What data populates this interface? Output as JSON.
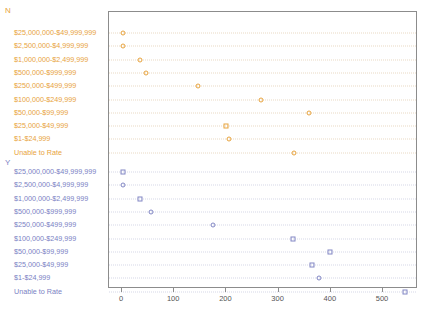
{
  "chart_data": {
    "type": "scatter",
    "title": "",
    "subtitle": "",
    "xlabel": "",
    "ylabel": "",
    "xlim": [
      -25,
      567
    ],
    "ylim": null,
    "grid": true,
    "legend_position": "none",
    "orientation": "horizontal",
    "panel_variable": "Rating",
    "categories": [
      "$25,000,000-$49,999,999",
      "$2,500,000-$4,999,999",
      "$1,000,000-$2,499,999",
      "$500,000-$999,999",
      "$250,000-$499,999",
      "$100,000-$249,999",
      "$50,000-$99,999",
      "$25,000-$49,999",
      "$1-$24,999",
      "Unable to Rate"
    ],
    "panels": [
      {
        "name": "N",
        "label": "N",
        "color": "#e8a33d",
        "values": [
          3,
          3,
          36,
          47,
          148,
          268,
          360,
          201,
          206,
          331
        ],
        "markers": [
          "circle",
          "circle",
          "circle",
          "circle",
          "circle",
          "circle",
          "circle",
          "square",
          "circle",
          "circle"
        ]
      },
      {
        "name": "Y",
        "label": "Y",
        "color": "#8186c4",
        "values": [
          4,
          3,
          37,
          57,
          177,
          329,
          401,
          365,
          379,
          544
        ],
        "markers": [
          "square",
          "circle",
          "square",
          "circle",
          "circle",
          "square",
          "square",
          "square",
          "circle",
          "square"
        ]
      }
    ],
    "xticks": [
      0,
      100,
      200,
      300,
      400,
      500
    ],
    "xtick_labels": [
      "0",
      "100",
      "200",
      "300",
      "400",
      "500"
    ]
  },
  "axis": {
    "frame_color": "#8c8c8c",
    "tick_color": "#555555"
  }
}
